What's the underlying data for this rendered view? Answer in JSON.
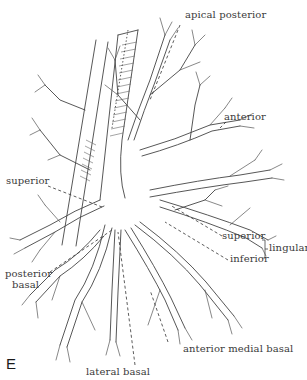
{
  "figure": {
    "panel_letter": "E",
    "labels": {
      "apical_posterior": "apical posterior",
      "anterior": "anterior",
      "superior_left": "superior",
      "lingular_superior": "superior",
      "lingular_inferior": "inferior",
      "lingular": "lingular",
      "posterior_basal_line1": "posterior",
      "posterior_basal_line2": "basal",
      "anterior_medial_basal": "anterior medial basal",
      "lateral_basal": "lateral basal"
    },
    "colors": {
      "line": "#444444",
      "text": "#3a3a3a",
      "background": "#ffffff"
    }
  }
}
